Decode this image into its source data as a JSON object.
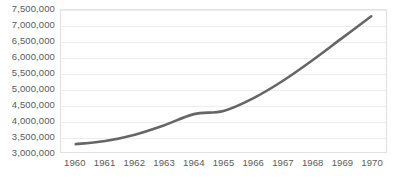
{
  "chart_data": {
    "type": "line",
    "title": "",
    "subtitle": "",
    "xlabel": "",
    "ylabel": "",
    "categories": [
      "1960",
      "1961",
      "1962",
      "1963",
      "1964",
      "1965",
      "1966",
      "1967",
      "1968",
      "1969",
      "1970"
    ],
    "x": [
      1960,
      1961,
      1962,
      1963,
      1964,
      1965,
      1966,
      1967,
      1968,
      1969,
      1970
    ],
    "values": [
      3250000,
      3350000,
      3550000,
      3850000,
      4200000,
      4300000,
      4700000,
      5250000,
      5900000,
      6600000,
      7300000
    ],
    "series": [
      {
        "name": "",
        "values": [
          3250000,
          3350000,
          3550000,
          3850000,
          4200000,
          4300000,
          4700000,
          5250000,
          5900000,
          6600000,
          7300000
        ],
        "color": "#666666",
        "line_width": 2.6,
        "smooth": true,
        "markers": false
      }
    ],
    "ylim": [
      3000000,
      7500000
    ],
    "ytick_values": [
      3000000,
      3500000,
      4000000,
      4500000,
      5000000,
      5500000,
      6000000,
      6500000,
      7000000,
      7500000
    ],
    "ytick_labels": [
      "3,000,000",
      "3,500,000",
      "4,000,000",
      "4,500,000",
      "5,000,000",
      "5,500,000",
      "6,000,000",
      "6,500,000",
      "7,000,000",
      "7,500,000"
    ],
    "xtick_labels": [
      "1960",
      "1961",
      "1962",
      "1963",
      "1964",
      "1965",
      "1966",
      "1967",
      "1968",
      "1969",
      "1970"
    ],
    "grid": {
      "horizontal": true,
      "vertical": false,
      "color": "#ededed"
    },
    "legend": {
      "visible": false,
      "position": "none",
      "entries": []
    },
    "plot_border_color": "#e2e2e2",
    "background_color": "#ffffff",
    "tick_label_color": "#5a5a5a",
    "annotations": []
  }
}
